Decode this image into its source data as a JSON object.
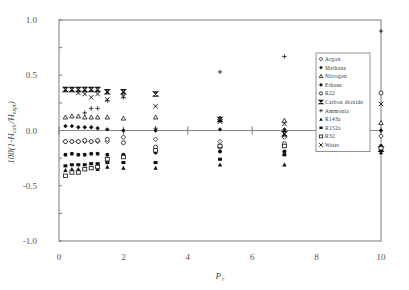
{
  "chart_data": {
    "type": "scatter",
    "title": "",
    "xlabel": "P r",
    "ylabel": "100(1-H calc/H expt)",
    "xlim": [
      0,
      10
    ],
    "ylim": [
      -1.0,
      1.0
    ],
    "x_ticks": [
      0,
      2,
      4,
      6,
      8,
      10
    ],
    "x_tick_labels": [
      "0",
      "2",
      "4",
      "6",
      "8",
      "10"
    ],
    "y_ticks": [
      1.0,
      0.5,
      0.0,
      -0.5,
      -1.0
    ],
    "y_tick_labels": [
      "1.0",
      "0.5",
      "0.0",
      "-0.5",
      "-1.0"
    ],
    "grid": false,
    "legend_position": "upper right (inside)",
    "series": [
      {
        "name": "Argon",
        "marker": "diamond-open",
        "points": [
          [
            0.2,
            -0.1
          ],
          [
            0.4,
            -0.1
          ],
          [
            0.6,
            -0.1
          ],
          [
            0.8,
            -0.1
          ],
          [
            1.0,
            -0.1
          ],
          [
            1.2,
            -0.1
          ],
          [
            1.5,
            -0.1
          ],
          [
            2.0,
            -0.06
          ],
          [
            3.0,
            -0.08
          ],
          [
            5.0,
            -0.1
          ],
          [
            7.0,
            -0.06
          ],
          [
            10.0,
            -0.05
          ]
        ]
      },
      {
        "name": "Methane",
        "marker": "diamond-filled",
        "points": [
          [
            0.2,
            0.04
          ],
          [
            0.4,
            0.04
          ],
          [
            0.6,
            0.03
          ],
          [
            0.8,
            0.03
          ],
          [
            1.0,
            0.03
          ],
          [
            1.2,
            0.02
          ],
          [
            1.5,
            0.01
          ],
          [
            2.0,
            0.0
          ],
          [
            3.0,
            0.0
          ],
          [
            5.0,
            0.01
          ],
          [
            7.0,
            0.01
          ],
          [
            10.0,
            0.0
          ]
        ]
      },
      {
        "name": "Nitrogen",
        "marker": "triangle-open",
        "points": [
          [
            0.2,
            0.12
          ],
          [
            0.4,
            0.13
          ],
          [
            0.6,
            0.13
          ],
          [
            0.8,
            0.12
          ],
          [
            1.0,
            0.12
          ],
          [
            1.2,
            0.12
          ],
          [
            1.5,
            0.12
          ],
          [
            2.0,
            0.11
          ],
          [
            3.0,
            0.12
          ],
          [
            5.0,
            0.11
          ],
          [
            7.0,
            0.09
          ],
          [
            10.0,
            0.07
          ]
        ]
      },
      {
        "name": "Ethane",
        "marker": "circle-filled",
        "points": [
          [
            0.2,
            -0.22
          ],
          [
            0.4,
            -0.21
          ],
          [
            0.6,
            -0.22
          ],
          [
            0.8,
            -0.22
          ],
          [
            1.0,
            -0.21
          ],
          [
            1.2,
            -0.21
          ],
          [
            1.5,
            -0.22
          ],
          [
            2.0,
            -0.22
          ],
          [
            3.0,
            -0.2
          ],
          [
            5.0,
            -0.19
          ],
          [
            7.0,
            -0.19
          ],
          [
            10.0,
            -0.14
          ]
        ]
      },
      {
        "name": "R22",
        "marker": "circle-open",
        "points": [
          [
            0.2,
            -0.1
          ],
          [
            0.4,
            -0.1
          ],
          [
            0.6,
            -0.1
          ],
          [
            0.8,
            -0.09
          ],
          [
            1.0,
            -0.1
          ],
          [
            1.2,
            -0.09
          ],
          [
            1.5,
            -0.08
          ],
          [
            2.0,
            -0.11
          ],
          [
            3.0,
            -0.15
          ],
          [
            5.0,
            -0.15
          ],
          [
            7.0,
            -0.12
          ],
          [
            10.0,
            0.34
          ]
        ]
      },
      {
        "name": "Carbon dioxide",
        "marker": "hourglass",
        "points": [
          [
            0.2,
            0.37
          ],
          [
            0.4,
            0.37
          ],
          [
            0.6,
            0.37
          ],
          [
            0.8,
            0.37
          ],
          [
            1.0,
            0.37
          ],
          [
            1.2,
            0.37
          ],
          [
            1.5,
            0.35
          ],
          [
            2.0,
            0.35
          ],
          [
            3.0,
            0.33
          ],
          [
            5.0,
            0.1
          ],
          [
            7.0,
            -0.03
          ],
          [
            10.0,
            -0.17
          ]
        ]
      },
      {
        "name": "Ammonia",
        "marker": "plus",
        "points": [
          [
            0.8,
            0.16
          ],
          [
            1.0,
            0.2
          ],
          [
            1.2,
            0.2
          ],
          [
            1.5,
            0.27
          ],
          [
            2.0,
            0.3
          ],
          [
            3.0,
            0.02
          ],
          [
            5.0,
            0.53
          ],
          [
            7.0,
            0.67
          ],
          [
            10.0,
            0.9
          ]
        ]
      },
      {
        "name": "R143a",
        "marker": "triangle-filled",
        "points": [
          [
            0.2,
            -0.36
          ],
          [
            0.4,
            -0.35
          ],
          [
            0.6,
            -0.35
          ],
          [
            0.8,
            -0.35
          ],
          [
            1.0,
            -0.34
          ],
          [
            1.2,
            -0.35
          ],
          [
            1.5,
            -0.33
          ],
          [
            2.0,
            -0.34
          ],
          [
            3.0,
            -0.34
          ],
          [
            5.0,
            -0.31
          ],
          [
            7.0,
            -0.31
          ],
          [
            10.0,
            -0.2
          ]
        ]
      },
      {
        "name": "R152a",
        "marker": "square-filled",
        "points": [
          [
            0.2,
            -0.32
          ],
          [
            0.4,
            -0.31
          ],
          [
            0.6,
            -0.31
          ],
          [
            0.8,
            -0.31
          ],
          [
            1.0,
            -0.3
          ],
          [
            1.2,
            -0.3
          ],
          [
            1.5,
            -0.29
          ],
          [
            2.0,
            -0.29
          ],
          [
            3.0,
            -0.29
          ],
          [
            5.0,
            -0.26
          ],
          [
            7.0,
            -0.22
          ],
          [
            10.0,
            -0.18
          ]
        ]
      },
      {
        "name": "R32",
        "marker": "square-open",
        "points": [
          [
            0.2,
            -0.41
          ],
          [
            0.4,
            -0.38
          ],
          [
            0.6,
            -0.38
          ],
          [
            0.8,
            -0.35
          ],
          [
            1.0,
            -0.34
          ],
          [
            1.2,
            -0.33
          ],
          [
            1.5,
            -0.26
          ],
          [
            2.0,
            -0.24
          ],
          [
            3.0,
            -0.18
          ],
          [
            5.0,
            -0.14
          ],
          [
            7.0,
            -0.14
          ],
          [
            10.0,
            -0.16
          ]
        ]
      },
      {
        "name": "Water",
        "marker": "x",
        "points": [
          [
            0.6,
            0.34
          ],
          [
            0.8,
            0.33
          ],
          [
            1.0,
            0.3
          ],
          [
            1.2,
            0.33
          ],
          [
            1.5,
            0.28
          ],
          [
            2.0,
            0.31
          ],
          [
            3.0,
            0.22
          ],
          [
            5.0,
            0.08
          ],
          [
            7.0,
            0.06
          ],
          [
            10.0,
            0.24
          ]
        ]
      }
    ]
  }
}
